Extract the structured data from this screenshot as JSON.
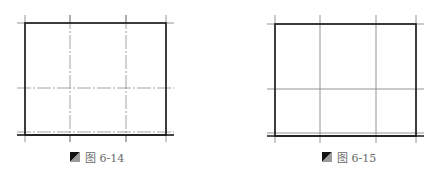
{
  "figures": [
    {
      "id": "fig-left",
      "caption_label": "图 6-14",
      "line_style": "dash-dot",
      "rect": {
        "left": 25,
        "top": 23,
        "right": 166,
        "bottom": 135
      },
      "inner_bottom_line_y": 132,
      "vertical_axes_x": [
        25,
        70,
        126,
        166
      ],
      "horizontal_axes_y": [
        23,
        88,
        132,
        135
      ]
    },
    {
      "id": "fig-right",
      "caption_label": "图 6-15",
      "line_style": "solid",
      "rect": {
        "left": 275,
        "top": 24,
        "right": 416,
        "bottom": 136
      },
      "inner_bottom_line_y": 133,
      "vertical_axes_x": [
        275,
        320,
        376,
        416
      ],
      "horizontal_axes_y": [
        24,
        89,
        133,
        136
      ]
    }
  ],
  "colors": {
    "frame": "#1a1a1a",
    "axis": "#7a7a7a",
    "caption_text": "#6a6a6a",
    "icon_dark": "#111111",
    "icon_light": "#9a9a9a"
  },
  "caption_icon": "half-triangle-figure-icon"
}
